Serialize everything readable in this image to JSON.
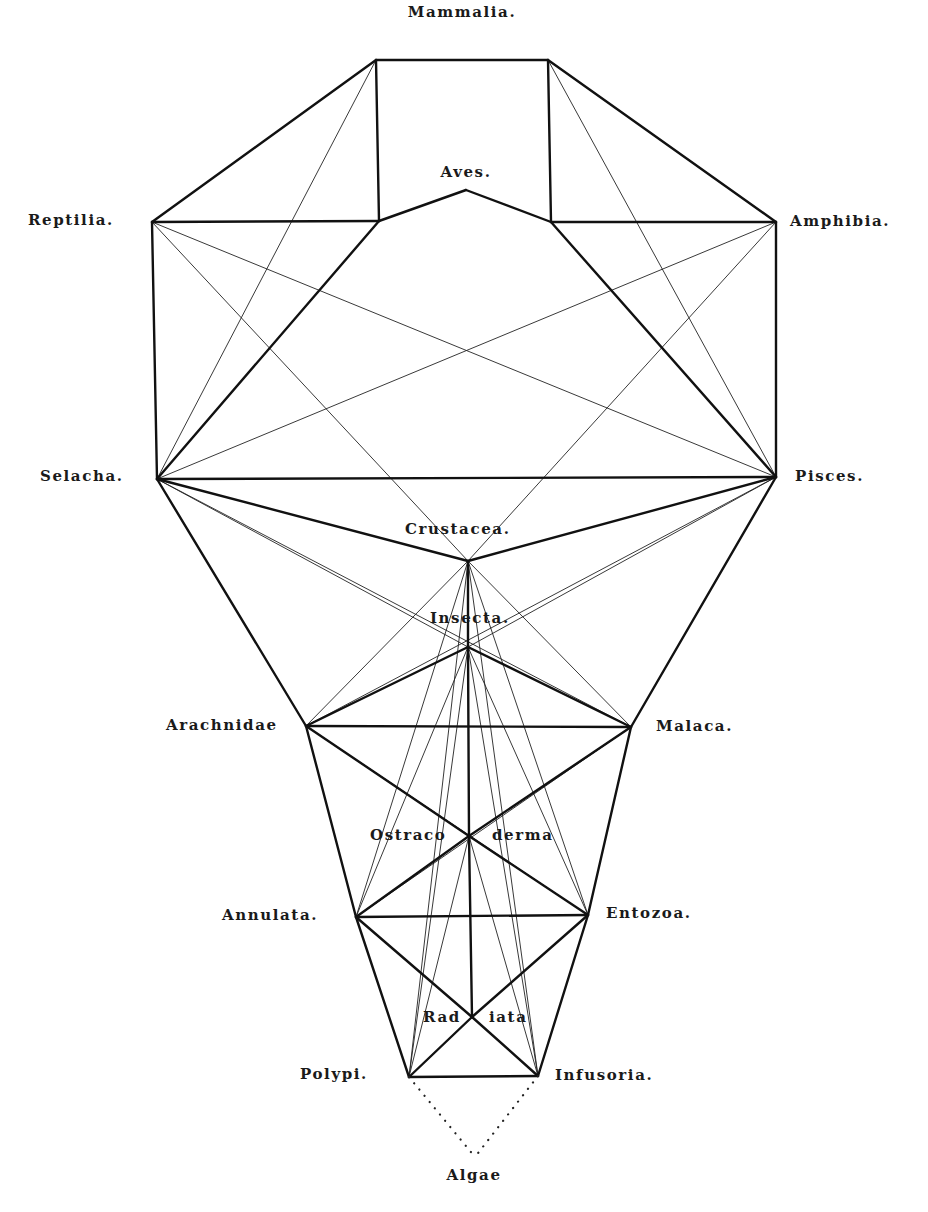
{
  "colors": {
    "background": "#ffffff",
    "ink": "#111111"
  },
  "nodes": [
    {
      "id": "mammalia_l",
      "x": 376,
      "y": 60
    },
    {
      "id": "mammalia_r",
      "x": 548,
      "y": 60
    },
    {
      "id": "aves_l",
      "x": 379,
      "y": 221
    },
    {
      "id": "aves_peak",
      "x": 466,
      "y": 190
    },
    {
      "id": "aves_r",
      "x": 551,
      "y": 222
    },
    {
      "id": "reptilia",
      "x": 152,
      "y": 222
    },
    {
      "id": "amphibia",
      "x": 776,
      "y": 222
    },
    {
      "id": "selacha",
      "x": 157,
      "y": 479
    },
    {
      "id": "pisces",
      "x": 776,
      "y": 477
    },
    {
      "id": "crustacea",
      "x": 468,
      "y": 561
    },
    {
      "id": "insecta",
      "x": 468,
      "y": 647
    },
    {
      "id": "arachnidae",
      "x": 306,
      "y": 726
    },
    {
      "id": "malaca",
      "x": 631,
      "y": 727
    },
    {
      "id": "ostracoderma",
      "x": 469,
      "y": 836
    },
    {
      "id": "annulata",
      "x": 356,
      "y": 917
    },
    {
      "id": "entozoa",
      "x": 588,
      "y": 915
    },
    {
      "id": "radiata",
      "x": 472,
      "y": 1017
    },
    {
      "id": "polypi",
      "x": 409,
      "y": 1077
    },
    {
      "id": "infusoria",
      "x": 538,
      "y": 1076
    },
    {
      "id": "algae",
      "x": 475,
      "y": 1157
    }
  ],
  "labels": [
    {
      "text": "Mammalia.",
      "x": 462,
      "y": 17,
      "anchor": "middle"
    },
    {
      "text": "Aves.",
      "x": 466,
      "y": 177,
      "anchor": "middle"
    },
    {
      "text": "Reptilia.",
      "x": 28,
      "y": 225,
      "anchor": "start"
    },
    {
      "text": "Amphibia.",
      "x": 790,
      "y": 226,
      "anchor": "start"
    },
    {
      "text": "Selacha.",
      "x": 40,
      "y": 481,
      "anchor": "start"
    },
    {
      "text": "Pisces.",
      "x": 795,
      "y": 481,
      "anchor": "start"
    },
    {
      "text": "Crustacea.",
      "x": 405,
      "y": 534,
      "anchor": "start"
    },
    {
      "text": "Insecta.",
      "x": 430,
      "y": 623,
      "anchor": "start"
    },
    {
      "text": "Arachnidae",
      "x": 166,
      "y": 730,
      "anchor": "start"
    },
    {
      "text": "Malaca.",
      "x": 656,
      "y": 731,
      "anchor": "start"
    },
    {
      "text": "Ostraco",
      "x": 370,
      "y": 840,
      "anchor": "start"
    },
    {
      "text": "derma",
      "x": 492,
      "y": 840,
      "anchor": "start"
    },
    {
      "text": "Annulata.",
      "x": 222,
      "y": 920,
      "anchor": "start"
    },
    {
      "text": "Entozoa.",
      "x": 606,
      "y": 918,
      "anchor": "start"
    },
    {
      "text": "Rad",
      "x": 423,
      "y": 1022,
      "anchor": "start"
    },
    {
      "text": "iata",
      "x": 489,
      "y": 1022,
      "anchor": "start"
    },
    {
      "text": "Polypi.",
      "x": 300,
      "y": 1079,
      "anchor": "start"
    },
    {
      "text": "Infusoria.",
      "x": 555,
      "y": 1080,
      "anchor": "start"
    },
    {
      "text": "Algae",
      "x": 474,
      "y": 1180,
      "anchor": "middle"
    }
  ],
  "edges": {
    "thick": [
      [
        "mammalia_l",
        "mammalia_r"
      ],
      [
        "mammalia_l",
        "aves_l"
      ],
      [
        "mammalia_r",
        "aves_r"
      ],
      [
        "aves_l",
        "aves_peak"
      ],
      [
        "aves_peak",
        "aves_r"
      ],
      [
        "mammalia_l",
        "reptilia"
      ],
      [
        "mammalia_r",
        "amphibia"
      ],
      [
        "reptilia",
        "aves_l"
      ],
      [
        "aves_r",
        "amphibia"
      ],
      [
        "reptilia",
        "selacha"
      ],
      [
        "amphibia",
        "pisces"
      ],
      [
        "aves_l",
        "selacha"
      ],
      [
        "aves_r",
        "pisces"
      ],
      [
        "selacha",
        "pisces"
      ],
      [
        "selacha",
        "crustacea"
      ],
      [
        "pisces",
        "crustacea"
      ],
      [
        "selacha",
        "arachnidae"
      ],
      [
        "pisces",
        "malaca"
      ],
      [
        "crustacea",
        "insecta"
      ],
      [
        "insecta",
        "ostracoderma"
      ],
      [
        "ostracoderma",
        "radiata"
      ],
      [
        "insecta",
        "arachnidae"
      ],
      [
        "insecta",
        "malaca"
      ],
      [
        "arachnidae",
        "malaca"
      ],
      [
        "arachnidae",
        "ostracoderma"
      ],
      [
        "malaca",
        "ostracoderma"
      ],
      [
        "arachnidae",
        "annulata"
      ],
      [
        "malaca",
        "entozoa"
      ],
      [
        "ostracoderma",
        "annulata"
      ],
      [
        "ostracoderma",
        "entozoa"
      ],
      [
        "annulata",
        "entozoa"
      ],
      [
        "annulata",
        "radiata"
      ],
      [
        "entozoa",
        "radiata"
      ],
      [
        "annulata",
        "polypi"
      ],
      [
        "entozoa",
        "infusoria"
      ],
      [
        "radiata",
        "polypi"
      ],
      [
        "radiata",
        "infusoria"
      ],
      [
        "polypi",
        "infusoria"
      ]
    ],
    "thin": [
      [
        "mammalia_l",
        "selacha"
      ],
      [
        "mammalia_r",
        "pisces"
      ],
      [
        "reptilia",
        "pisces"
      ],
      [
        "amphibia",
        "selacha"
      ],
      [
        "reptilia",
        "crustacea"
      ],
      [
        "amphibia",
        "crustacea"
      ],
      [
        "selacha",
        "insecta"
      ],
      [
        "pisces",
        "insecta"
      ],
      [
        "selacha",
        "malaca"
      ],
      [
        "pisces",
        "arachnidae"
      ],
      [
        "crustacea",
        "arachnidae"
      ],
      [
        "crustacea",
        "malaca"
      ],
      [
        "crustacea",
        "annulata"
      ],
      [
        "crustacea",
        "entozoa"
      ],
      [
        "insecta",
        "annulata"
      ],
      [
        "insecta",
        "entozoa"
      ],
      [
        "crustacea",
        "polypi"
      ],
      [
        "crustacea",
        "infusoria"
      ],
      [
        "insecta",
        "polypi"
      ],
      [
        "insecta",
        "infusoria"
      ],
      [
        "ostracoderma",
        "polypi"
      ],
      [
        "ostracoderma",
        "infusoria"
      ],
      [
        "arachnidae",
        "entozoa"
      ],
      [
        "malaca",
        "annulata"
      ]
    ],
    "dotted": [
      [
        "polypi",
        "algae"
      ],
      [
        "infusoria",
        "algae"
      ]
    ]
  }
}
